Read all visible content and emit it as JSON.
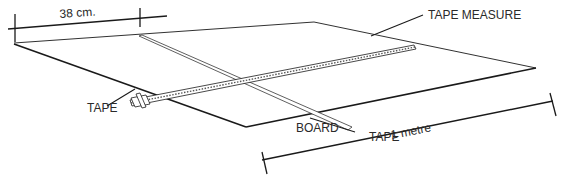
{
  "diagram": {
    "title": "",
    "labels": {
      "width_dimension": "38 cm.",
      "tape_measure": "TAPE MEASURE",
      "tape_left": "TAPE",
      "tape_right": "TAPE",
      "board": "BOARD",
      "length_dimension": "1 metre"
    },
    "colors": {
      "line": "#1a1a1a",
      "text": "#2a2a2a",
      "background": "#ffffff"
    }
  }
}
